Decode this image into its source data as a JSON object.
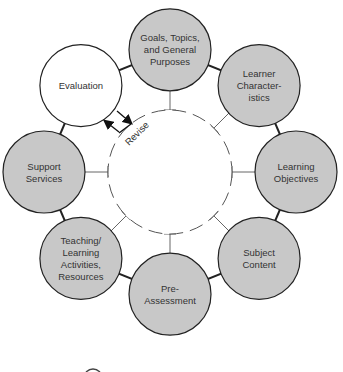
{
  "diagram": {
    "center": {
      "label": "",
      "style": "dashed"
    },
    "revise_label": "Revise",
    "nodes": [
      {
        "id": "goals",
        "lines": [
          "Goals, Topics,",
          "and General",
          "Purposes"
        ],
        "fill": "#c8c8c8"
      },
      {
        "id": "learner",
        "lines": [
          "Learner",
          "Character-",
          "istics"
        ],
        "fill": "#c8c8c8"
      },
      {
        "id": "objectives",
        "lines": [
          "Learning",
          "Objectives"
        ],
        "fill": "#c8c8c8"
      },
      {
        "id": "content",
        "lines": [
          "Subject",
          "Content"
        ],
        "fill": "#c8c8c8"
      },
      {
        "id": "preassessment",
        "lines": [
          "Pre-",
          "Assessment"
        ],
        "fill": "#c8c8c8"
      },
      {
        "id": "teaching",
        "lines": [
          "Teaching/",
          "Learning",
          "Activities,",
          "Resources"
        ],
        "fill": "#c8c8c8"
      },
      {
        "id": "support",
        "lines": [
          "Support",
          "Services"
        ],
        "fill": "#c8c8c8"
      },
      {
        "id": "evaluation",
        "lines": [
          "Evaluation"
        ],
        "fill": "#ffffff"
      }
    ],
    "colors": {
      "stroke": "#222222",
      "text": "#333333",
      "connector": "#555555"
    }
  }
}
